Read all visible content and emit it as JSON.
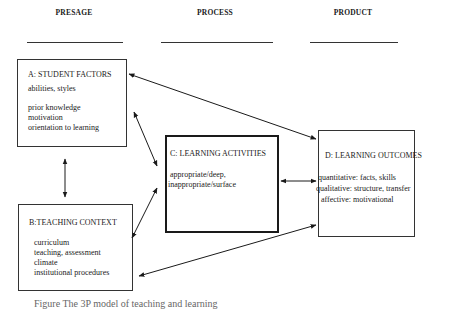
{
  "headers": {
    "presage": "PRESAGE",
    "process": "PROCESS",
    "product": "PRODUCT"
  },
  "boxes": {
    "student_factors": {
      "title": "A: STUDENT  FACTORS",
      "lines": [
        "abilities, styles",
        "prior knowledge",
        "motivation",
        "orientation to learning"
      ]
    },
    "teaching_context": {
      "title": "B:TEACHING CONTEXT",
      "lines": [
        "curriculum",
        "teaching, assessment",
        "climate",
        "institutional procedures"
      ]
    },
    "learning_activities": {
      "title": "C: LEARNING ACTIVITIES",
      "lines": [
        "appropriate/deep,",
        "inappropriate/surface"
      ]
    },
    "learning_outcomes": {
      "title": "D: LEARNING  OUTCOMES",
      "lines": [
        "quantitative: facts, skills",
        "qualitative: structure, transfer",
        "affective: motivational"
      ]
    }
  },
  "caption": "Figure    The 3P model of teaching and learning",
  "colors": {
    "ink": "#1a1a1a",
    "background": "#ffffff"
  }
}
